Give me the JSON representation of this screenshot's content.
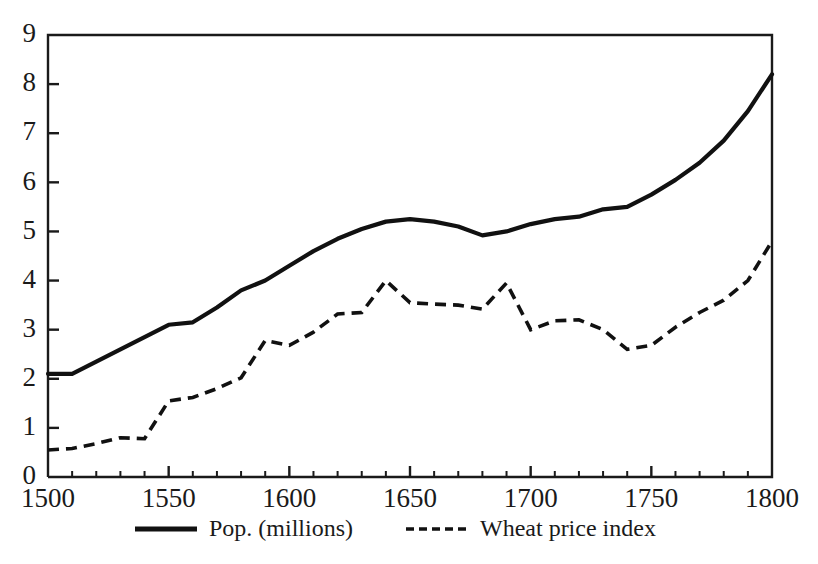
{
  "chart_data": {
    "type": "line",
    "title": "",
    "subtitle": "",
    "xlabel": "",
    "ylabel": "",
    "xlim": [
      1500,
      1800
    ],
    "ylim": [
      0,
      9
    ],
    "grid": false,
    "legend_position": "bottom-center",
    "x_ticks": [
      1500,
      1550,
      1600,
      1650,
      1700,
      1750,
      1800
    ],
    "x_tick_labels": [
      "1500",
      "1550",
      "1600",
      "1650",
      "1700",
      "1750",
      "1800"
    ],
    "x_minor_tick_step": 10,
    "y_ticks": [
      0,
      1,
      2,
      3,
      4,
      5,
      6,
      7,
      8,
      9
    ],
    "y_tick_labels": [
      "0",
      "1",
      "2",
      "3",
      "4",
      "5",
      "6",
      "7",
      "8",
      "9"
    ],
    "series": [
      {
        "name": "Pop. (millions)",
        "style": "solid",
        "color": "#111111",
        "x": [
          1500,
          1510,
          1520,
          1530,
          1540,
          1550,
          1560,
          1570,
          1580,
          1590,
          1600,
          1610,
          1620,
          1630,
          1640,
          1650,
          1660,
          1670,
          1680,
          1690,
          1700,
          1710,
          1720,
          1730,
          1740,
          1750,
          1760,
          1770,
          1780,
          1790,
          1800
        ],
        "y": [
          2.1,
          2.1,
          2.35,
          2.6,
          2.85,
          3.1,
          3.15,
          3.45,
          3.8,
          4.0,
          4.3,
          4.6,
          4.85,
          5.05,
          5.2,
          5.25,
          5.2,
          5.1,
          4.92,
          5.0,
          5.15,
          5.25,
          5.3,
          5.45,
          5.5,
          5.75,
          6.05,
          6.4,
          6.85,
          7.45,
          8.2
        ]
      },
      {
        "name": "Wheat price index",
        "style": "dashed",
        "color": "#111111",
        "x": [
          1500,
          1510,
          1520,
          1530,
          1540,
          1550,
          1560,
          1570,
          1580,
          1590,
          1600,
          1610,
          1620,
          1630,
          1640,
          1650,
          1660,
          1670,
          1680,
          1690,
          1700,
          1710,
          1720,
          1730,
          1740,
          1750,
          1760,
          1770,
          1780,
          1790,
          1800
        ],
        "y": [
          0.55,
          0.58,
          0.68,
          0.8,
          0.78,
          1.55,
          1.62,
          1.8,
          2.02,
          2.78,
          2.68,
          2.95,
          3.32,
          3.35,
          4.0,
          3.55,
          3.52,
          3.5,
          3.42,
          3.95,
          3.0,
          3.18,
          3.2,
          3.0,
          2.6,
          2.68,
          3.05,
          3.35,
          3.6,
          4.0,
          4.8
        ]
      }
    ]
  },
  "legend": {
    "entries": [
      {
        "label": "Pop. (millions)",
        "style": "solid"
      },
      {
        "label": "Wheat price index",
        "style": "dashed"
      }
    ]
  }
}
